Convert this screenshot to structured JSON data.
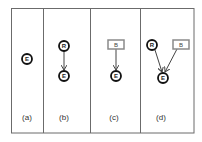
{
  "panels": [
    {
      "label": "(a)",
      "nodes": [
        {
          "id": "E",
          "text": "E",
          "type": "circle"
        }
      ],
      "edges": []
    },
    {
      "label": "(b)",
      "nodes": [
        {
          "id": "R",
          "text": "R",
          "type": "circle"
        },
        {
          "id": "E",
          "text": "E",
          "type": "circle"
        }
      ],
      "edges": [
        {
          "from": "R",
          "to": "E"
        }
      ]
    },
    {
      "label": "(c)",
      "nodes": [
        {
          "id": "B",
          "text": "B",
          "type": "box"
        },
        {
          "id": "E",
          "text": "E",
          "type": "circle"
        }
      ],
      "edges": [
        {
          "from": "B",
          "to": "E"
        }
      ]
    },
    {
      "label": "(d)",
      "nodes": [
        {
          "id": "R",
          "text": "R",
          "type": "circle"
        },
        {
          "id": "B",
          "text": "B",
          "type": "box"
        },
        {
          "id": "E",
          "text": "E",
          "type": "circle"
        }
      ],
      "edges": [
        {
          "from": "R",
          "to": "E"
        },
        {
          "from": "B",
          "to": "E"
        }
      ]
    }
  ],
  "colors": {
    "border": "#6b6b6b",
    "circle_stroke": "#111111",
    "box_stroke": "#8a8a8a",
    "edge": "#444444"
  }
}
